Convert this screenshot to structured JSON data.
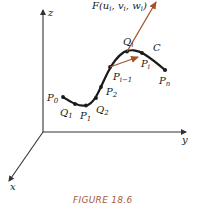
{
  "figure": {
    "caption": "FIGURE 18.6",
    "colors": {
      "curve": "#1a1a1a",
      "axes": "#333333",
      "vector": "#a5522a",
      "caption": "#a55a3a"
    },
    "axes": {
      "z": "z",
      "y": "y",
      "x": "x"
    },
    "curve_label": "C",
    "vector_label": "F(u",
    "vector_label_parts": {
      "F": "F(",
      "u": "u",
      "u_sub": "i",
      "sep1": ", ",
      "v": "v",
      "v_sub": "i",
      "sep2": ", ",
      "w": "w",
      "w_sub": "i",
      "close": ")"
    },
    "points": [
      {
        "name": "P",
        "sub": "0"
      },
      {
        "name": "Q",
        "sub": "1"
      },
      {
        "name": "P",
        "sub": "1"
      },
      {
        "name": "Q",
        "sub": "2"
      },
      {
        "name": "P",
        "sub": "2"
      },
      {
        "name": "P",
        "sub": "i−1"
      },
      {
        "name": "Q",
        "sub": "i"
      },
      {
        "name": "P",
        "sub": "i"
      },
      {
        "name": "P",
        "sub": "n"
      }
    ]
  }
}
